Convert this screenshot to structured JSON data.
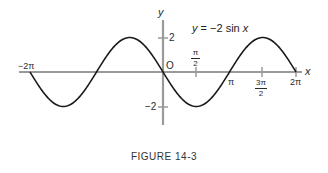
{
  "figure": {
    "caption": "FIGURE 14-3",
    "equation_label": "y = −2 sin x",
    "equation_parts": {
      "lhs": "y",
      "eq": " = ",
      "rhs_coef": "−2 sin ",
      "rhs_var": "x"
    }
  },
  "axes": {
    "x_label": "x",
    "y_label": "y",
    "origin_label": "O",
    "x_ticks": [
      {
        "label": "−2π",
        "value": -6.2832
      },
      {
        "label": "π/2",
        "num": "π",
        "den": "2",
        "value": 1.5708
      },
      {
        "label": "π",
        "value": 3.1416
      },
      {
        "label": "3π/2",
        "num": "3π",
        "den": "2",
        "value": 4.7124
      },
      {
        "label": "2π",
        "value": 6.2832
      }
    ],
    "y_ticks": [
      {
        "label": "2",
        "value": 2
      },
      {
        "label": "−2",
        "value": -2
      }
    ]
  },
  "chart_data": {
    "type": "line",
    "title": "y = −2 sin x",
    "caption": "FIGURE 14-3",
    "xlabel": "x",
    "ylabel": "y",
    "xlim": [
      -6.2832,
      6.2832
    ],
    "ylim": [
      -2,
      2
    ],
    "grid": false,
    "x_tick_labels": [
      "−2π",
      "π/2",
      "π",
      "3π/2",
      "2π"
    ],
    "y_tick_labels": [
      "2",
      "−2"
    ],
    "series": [
      {
        "name": "y = −2 sin x",
        "function": "-2*sin(x)",
        "x": [
          -6.2832,
          -4.7124,
          -3.1416,
          -1.5708,
          0,
          1.5708,
          3.1416,
          4.7124,
          6.2832
        ],
        "values": [
          0,
          -2,
          0,
          2,
          0,
          -2,
          0,
          2,
          0
        ]
      }
    ],
    "colors": {
      "curve": "#1a1a1a",
      "axes": "#9a9a9a"
    }
  }
}
